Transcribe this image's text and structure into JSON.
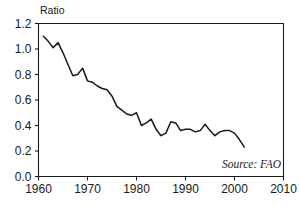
{
  "chart_data": {
    "type": "line",
    "title": "",
    "subtitle": "",
    "xlabel": "",
    "ylabel": "Ratio",
    "ylabel_position": "top-left",
    "xlim": [
      1960,
      2010
    ],
    "ylim": [
      0.0,
      1.2
    ],
    "grid": false,
    "legend": null,
    "legend_position": "none",
    "annotations": [
      {
        "name": "source-note",
        "text": "Source: FAO",
        "x": 2001,
        "y": 0.11,
        "align": "right",
        "style": "italic"
      }
    ],
    "xticks": [
      1960,
      1970,
      1980,
      1990,
      2000,
      2010
    ],
    "xtick_labels": [
      "1960",
      "1970",
      "1980",
      "1990",
      "2000",
      "2010"
    ],
    "yticks": [
      0.0,
      0.2,
      0.4,
      0.6,
      0.8,
      1.0,
      1.2
    ],
    "ytick_labels": [
      "0.0",
      "0.2",
      "0.4",
      "0.6",
      "0.8",
      "1.0",
      "1.2"
    ],
    "series": [
      {
        "name": "Ratio",
        "color": "#1a1a1a",
        "x": [
          1961,
          1962,
          1963,
          1964,
          1965,
          1966,
          1967,
          1968,
          1969,
          1970,
          1971,
          1972,
          1973,
          1974,
          1975,
          1976,
          1977,
          1978,
          1979,
          1980,
          1981,
          1982,
          1983,
          1984,
          1985,
          1986,
          1987,
          1988,
          1989,
          1990,
          1991,
          1992,
          1993,
          1994,
          1995,
          1996,
          1997,
          1998,
          1999,
          2000,
          2001,
          2002
        ],
        "values": [
          1.1,
          1.06,
          1.01,
          1.05,
          0.97,
          0.88,
          0.79,
          0.8,
          0.85,
          0.75,
          0.74,
          0.71,
          0.69,
          0.68,
          0.63,
          0.55,
          0.52,
          0.49,
          0.48,
          0.5,
          0.4,
          0.42,
          0.45,
          0.37,
          0.32,
          0.34,
          0.43,
          0.42,
          0.36,
          0.37,
          0.37,
          0.35,
          0.36,
          0.41,
          0.36,
          0.32,
          0.35,
          0.36,
          0.36,
          0.34,
          0.29,
          0.23
        ]
      }
    ]
  },
  "axis_label": {
    "y": "Ratio"
  },
  "source": {
    "text": "Source: FAO"
  }
}
